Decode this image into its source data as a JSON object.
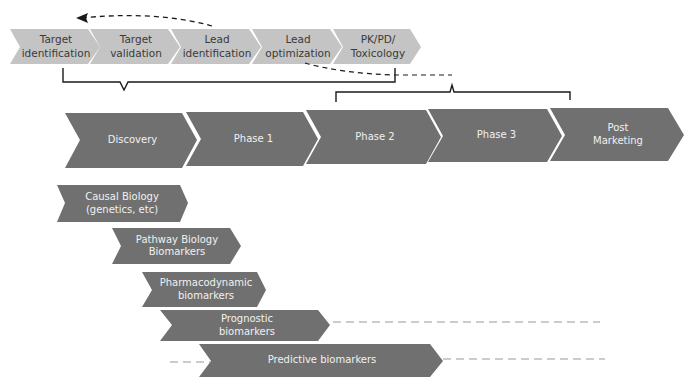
{
  "colors": {
    "light_chevron": "#c4c4c4",
    "dark_chevron": "#707070",
    "line": "#1a1a1a",
    "dash_gray": "#9a9a9a"
  },
  "top_stages": [
    {
      "label": "Target\nidentification"
    },
    {
      "label": "Target\nvalidation"
    },
    {
      "label": "Lead\nidentification"
    },
    {
      "label": "Lead\noptimization"
    },
    {
      "label": "PK/PD/\nToxicology"
    }
  ],
  "phases": [
    {
      "label": "Discovery"
    },
    {
      "label": "Phase 1"
    },
    {
      "label": "Phase 2"
    },
    {
      "label": "Phase 3"
    },
    {
      "label": "Post\nMarketing"
    }
  ],
  "biomarkers": [
    {
      "label": "Causal Biology\n(genetics, etc)"
    },
    {
      "label": "Pathway Biology\nBiomarkers"
    },
    {
      "label": "Pharmacodynamic\nbiomarkers"
    },
    {
      "label": "Prognostic\nbiomarkers"
    },
    {
      "label": "Predictive biomarkers"
    }
  ]
}
